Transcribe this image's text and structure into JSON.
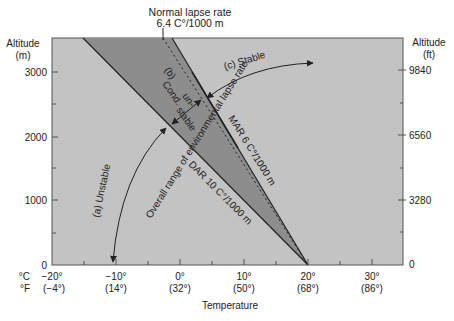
{
  "title": {
    "line1": "Normal lapse rate",
    "line2": "6.4 C°/1000 m"
  },
  "left_axis": {
    "title_line1": "Altitude",
    "title_line2": "(m)",
    "ticks": [
      "0",
      "1000",
      "2000",
      "3000"
    ]
  },
  "right_axis": {
    "title_line1": "Altitude",
    "title_line2": "(ft)",
    "ticks": [
      "0",
      "3280",
      "6560",
      "9840"
    ]
  },
  "x_axis": {
    "title": "Temperature",
    "unit_c": "°C",
    "unit_f": "°F",
    "celsius": [
      "−20°",
      "−10°",
      "0°",
      "10°",
      "20°",
      "30°"
    ],
    "fahrenheit": [
      "(−4°)",
      "(14°)",
      "(32°)",
      "(50°)",
      "(68°)",
      "(86°)"
    ]
  },
  "annotations": {
    "unstable": "(a) Unstable",
    "cond_b": "(b)",
    "cond_1": "Cond.",
    "cond_2": "un-",
    "cond_3": "stable",
    "stable": "(c) Stable",
    "overall": "Overall range of environmental lapse rate",
    "mar": "MAR 6 C°/1000 m",
    "dar": "DAR 10 C°/1000 m"
  },
  "colors": {
    "background": "#c3c3c3",
    "conditional_band": "#8d8d8d",
    "lines": "#222222"
  }
}
